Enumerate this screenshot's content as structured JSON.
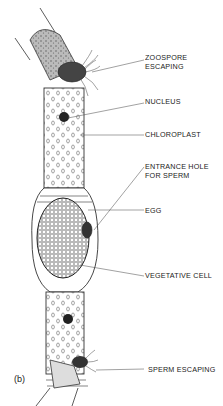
{
  "diagram": {
    "panel_label": "(b)",
    "labels": [
      {
        "id": "zoospore",
        "line1": "ZOOSPORE",
        "line2": "ESCAPING"
      },
      {
        "id": "nucleus",
        "line1": "NUCLEUS"
      },
      {
        "id": "chloroplast",
        "line1": "CHLOROPLAST"
      },
      {
        "id": "entrance",
        "line1": "ENTRANCE HOLE",
        "line2": "FOR SPERM"
      },
      {
        "id": "egg",
        "line1": "EGG"
      },
      {
        "id": "vegetative",
        "line1": "VEGETATIVE CELL"
      },
      {
        "id": "sperm",
        "line1": "SPERM ESCAPING"
      }
    ]
  }
}
